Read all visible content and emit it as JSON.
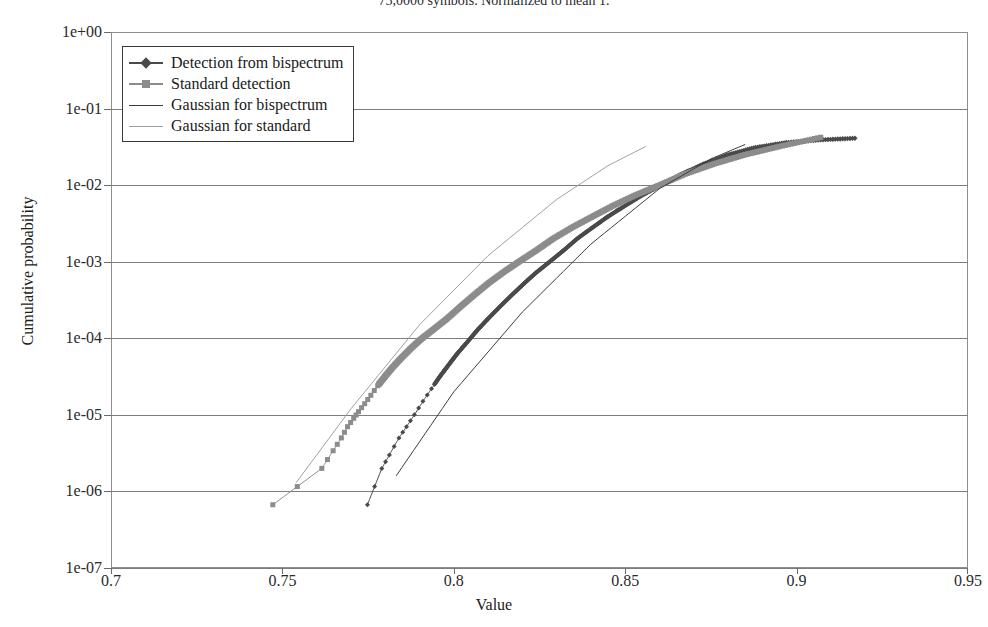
{
  "title": "75,0000 symbols. Normalized to mean 1.",
  "axes": {
    "xlabel": "Value",
    "ylabel": "Cumulative probability",
    "xticks": [
      "0.7",
      "0.75",
      "0.8",
      "0.85",
      "0.9",
      "0.95"
    ],
    "yticks": [
      "1e+00",
      "1e-01",
      "1e-02",
      "1e-03",
      "1e-04",
      "1e-05",
      "1e-06",
      "1e-07"
    ]
  },
  "legend": {
    "items": [
      {
        "label": "Detection from bispectrum",
        "marker": "diamond",
        "color": "#4a4a4a",
        "line": "thick"
      },
      {
        "label": "Standard detection",
        "marker": "square",
        "color": "#8c8c8c",
        "line": "thick"
      },
      {
        "label": "Gaussian for bispectrum",
        "marker": "none",
        "color": "#3c3c3c",
        "line": "thin"
      },
      {
        "label": "Gaussian for standard",
        "marker": "none",
        "color": "#a0a0a0",
        "line": "thin"
      }
    ]
  },
  "colors": {
    "bispectrum": "#4a4a4a",
    "standard": "#8c8c8c",
    "gaussian_bispectrum": "#3c3c3c",
    "gaussian_standard": "#a0a0a0",
    "frame": "#8e8e8e",
    "grid": "#7d7d7d",
    "background": "#ffffff"
  },
  "chart_data": {
    "type": "scatter",
    "title": "75,0000 symbols. Normalized to mean 1.",
    "xlabel": "Value",
    "ylabel": "Cumulative probability",
    "xlim": [
      0.7,
      0.95
    ],
    "ylim": [
      1e-07,
      1.0
    ],
    "yscale": "log",
    "xscale": "linear",
    "grid": true,
    "legend_position": "top-left",
    "series": [
      {
        "name": "Detection from bispectrum",
        "style": "markers-diamond",
        "color": "#4a4a4a",
        "points": [
          [
            0.7748,
            6.7e-07
          ],
          [
            0.779,
            2e-06
          ],
          [
            0.7812,
            3e-06
          ],
          [
            0.784,
            5e-06
          ],
          [
            0.7862,
            7e-06
          ],
          [
            0.7885,
            1e-05
          ],
          [
            0.791,
            1.5e-05
          ],
          [
            0.7935,
            2.2e-05
          ],
          [
            0.796,
            3.2e-05
          ],
          [
            0.7985,
            4.5e-05
          ],
          [
            0.801,
            6.3e-05
          ],
          [
            0.804,
            9e-05
          ],
          [
            0.807,
            0.00013
          ],
          [
            0.81,
            0.00018
          ],
          [
            0.8135,
            0.00026
          ],
          [
            0.817,
            0.00037
          ],
          [
            0.8205,
            0.00052
          ],
          [
            0.824,
            0.00072
          ],
          [
            0.828,
            0.001
          ],
          [
            0.832,
            0.0014
          ],
          [
            0.836,
            0.002
          ],
          [
            0.8405,
            0.0028
          ],
          [
            0.845,
            0.0039
          ],
          [
            0.85,
            0.0054
          ],
          [
            0.855,
            0.0074
          ],
          [
            0.8605,
            0.01
          ],
          [
            0.8665,
            0.014
          ],
          [
            0.873,
            0.019
          ],
          [
            0.88,
            0.025
          ],
          [
            0.888,
            0.031
          ],
          [
            0.897,
            0.036
          ],
          [
            0.907,
            0.039
          ],
          [
            0.917,
            0.041
          ]
        ]
      },
      {
        "name": "Standard detection",
        "style": "markers-square",
        "color": "#8c8c8c",
        "points": [
          [
            0.7472,
            6.7e-07
          ],
          [
            0.7615,
            2e-06
          ],
          [
            0.7648,
            3.4e-06
          ],
          [
            0.7672,
            5e-06
          ],
          [
            0.769,
            7e-06
          ],
          [
            0.7708,
            9e-06
          ],
          [
            0.7722,
            1.1e-05
          ],
          [
            0.774,
            1.4e-05
          ],
          [
            0.7758,
            1.8e-05
          ],
          [
            0.7778,
            2.4e-05
          ],
          [
            0.78,
            3.2e-05
          ],
          [
            0.7822,
            4.2e-05
          ],
          [
            0.7848,
            5.6e-05
          ],
          [
            0.7875,
            7.4e-05
          ],
          [
            0.7905,
            9.8e-05
          ],
          [
            0.794,
            0.00013
          ],
          [
            0.798,
            0.00018
          ],
          [
            0.802,
            0.00026
          ],
          [
            0.806,
            0.00037
          ],
          [
            0.81,
            0.00052
          ],
          [
            0.8145,
            0.00073
          ],
          [
            0.819,
            0.001
          ],
          [
            0.824,
            0.0014
          ],
          [
            0.829,
            0.002
          ],
          [
            0.8345,
            0.0028
          ],
          [
            0.8405,
            0.0039
          ],
          [
            0.8465,
            0.0054
          ],
          [
            0.853,
            0.0074
          ],
          [
            0.86,
            0.01
          ],
          [
            0.8675,
            0.014
          ],
          [
            0.876,
            0.019
          ],
          [
            0.885,
            0.025
          ],
          [
            0.895,
            0.032
          ],
          [
            0.907,
            0.042
          ]
        ]
      },
      {
        "name": "Gaussian for bispectrum",
        "style": "line-thin",
        "color": "#3c3c3c",
        "points": [
          [
            0.7832,
            1.6e-06
          ],
          [
            0.8,
            2e-05
          ],
          [
            0.82,
            0.00022
          ],
          [
            0.84,
            0.0017
          ],
          [
            0.86,
            0.009
          ],
          [
            0.875,
            0.022
          ],
          [
            0.885,
            0.034
          ]
        ]
      },
      {
        "name": "Gaussian for standard",
        "style": "line-thin",
        "color": "#a0a0a0",
        "points": [
          [
            0.754,
            1.3e-06
          ],
          [
            0.77,
            1.2e-05
          ],
          [
            0.79,
            0.00015
          ],
          [
            0.81,
            0.0012
          ],
          [
            0.83,
            0.0065
          ],
          [
            0.845,
            0.018
          ],
          [
            0.856,
            0.032
          ]
        ]
      }
    ]
  }
}
